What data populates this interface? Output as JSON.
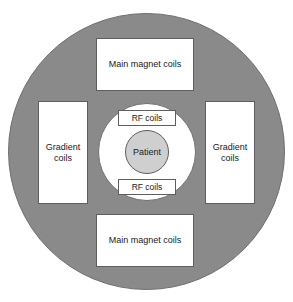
{
  "diagram": {
    "colors": {
      "ring_fill": "#8a8a8a",
      "bore_fill": "#ffffff",
      "patient_fill": "#cfcfcf",
      "box_fill": "#ffffff",
      "outline": "#5e5e5e",
      "text": "#1a1a1a",
      "background": "#ffffff"
    },
    "components": {
      "magnet_top": "Main magnet coils",
      "magnet_bottom": "Main magnet coils",
      "gradient_left": "Gradient coils",
      "gradient_right": "Gradient coils",
      "rf_top": "RF coils",
      "rf_bottom": "RF coils",
      "patient": "Patient"
    }
  }
}
